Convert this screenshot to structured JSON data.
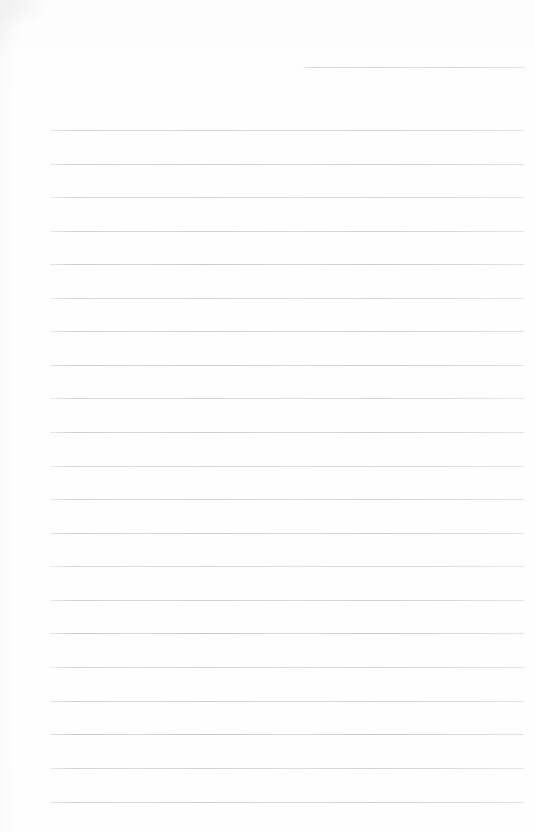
{
  "document": {
    "kind": "scanned-lined-paper",
    "title": "Blank ruled notebook page",
    "page_width": 535,
    "page_height": 832,
    "background_color": "#fefefe",
    "rule_color": "#c9cbcc",
    "rule_thickness_px": 1,
    "written_text": "",
    "notes": "No text, headings, marks or handwriting are present on the page."
  },
  "rules": {
    "count": 22,
    "full_width_count": 21,
    "partial_count": 1,
    "spacing_px": 33.6,
    "left_margin_px": 50,
    "right_margin_px": 524,
    "first_full_line_y": 130,
    "last_full_line_y": 802,
    "lines": [
      {
        "index": 0,
        "y": 67,
        "x1": 303,
        "x2": 525,
        "kind": "partial"
      },
      {
        "index": 1,
        "y": 130,
        "x1": 50,
        "x2": 524,
        "kind": "full"
      },
      {
        "index": 2,
        "y": 164,
        "x1": 50,
        "x2": 524,
        "kind": "full"
      },
      {
        "index": 3,
        "y": 197,
        "x1": 50,
        "x2": 524,
        "kind": "full"
      },
      {
        "index": 4,
        "y": 231,
        "x1": 50,
        "x2": 524,
        "kind": "full"
      },
      {
        "index": 5,
        "y": 264,
        "x1": 50,
        "x2": 524,
        "kind": "full"
      },
      {
        "index": 6,
        "y": 298,
        "x1": 50,
        "x2": 524,
        "kind": "full"
      },
      {
        "index": 7,
        "y": 331,
        "x1": 50,
        "x2": 524,
        "kind": "full"
      },
      {
        "index": 8,
        "y": 365,
        "x1": 50,
        "x2": 524,
        "kind": "full"
      },
      {
        "index": 9,
        "y": 398,
        "x1": 50,
        "x2": 524,
        "kind": "full"
      },
      {
        "index": 10,
        "y": 432,
        "x1": 50,
        "x2": 524,
        "kind": "full"
      },
      {
        "index": 11,
        "y": 466,
        "x1": 50,
        "x2": 524,
        "kind": "full"
      },
      {
        "index": 12,
        "y": 499,
        "x1": 50,
        "x2": 524,
        "kind": "full"
      },
      {
        "index": 13,
        "y": 533,
        "x1": 50,
        "x2": 524,
        "kind": "full"
      },
      {
        "index": 14,
        "y": 566,
        "x1": 50,
        "x2": 524,
        "kind": "full"
      },
      {
        "index": 15,
        "y": 600,
        "x1": 50,
        "x2": 524,
        "kind": "full"
      },
      {
        "index": 16,
        "y": 633,
        "x1": 50,
        "x2": 524,
        "kind": "full"
      },
      {
        "index": 17,
        "y": 667,
        "x1": 50,
        "x2": 524,
        "kind": "full"
      },
      {
        "index": 18,
        "y": 701,
        "x1": 50,
        "x2": 524,
        "kind": "full"
      },
      {
        "index": 19,
        "y": 734,
        "x1": 50,
        "x2": 524,
        "kind": "full"
      },
      {
        "index": 20,
        "y": 768,
        "x1": 50,
        "x2": 524,
        "kind": "full"
      },
      {
        "index": 21,
        "y": 802,
        "x1": 50,
        "x2": 524,
        "kind": "full"
      }
    ]
  },
  "artifacts": {
    "corner_smudge": {
      "present": true,
      "corner": "top-left",
      "color": "#96989b"
    },
    "left_edge_shadow": {
      "present": true,
      "color": "#a8aaad"
    }
  }
}
